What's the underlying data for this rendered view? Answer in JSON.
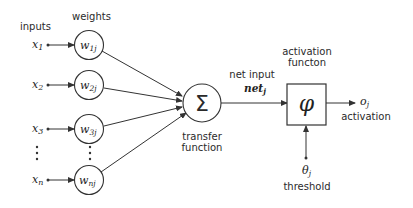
{
  "diagram": {
    "labels": {
      "inputs": "inputs",
      "weights": "weights",
      "net_input": "net input",
      "net_symbol": "net",
      "net_sub": "j",
      "transfer_line1": "transfer",
      "transfer_line2": "function",
      "activation_fn_line1": "activation",
      "activation_fn_line2": "functon",
      "output_symbol": "o",
      "output_sub": "j",
      "output_label": "activation",
      "threshold_symbol": "θ",
      "threshold_sub": "j",
      "threshold_label": "threshold",
      "sum_symbol": "Σ",
      "activation_symbol": "φ"
    },
    "inputs": [
      {
        "symbol": "x",
        "sub": "1",
        "weight": "w",
        "weight_sub": "1j"
      },
      {
        "symbol": "x",
        "sub": "2",
        "weight": "w",
        "weight_sub": "2j"
      },
      {
        "symbol": "x",
        "sub": "3",
        "weight": "w",
        "weight_sub": "3j"
      },
      {
        "symbol": "x",
        "sub": "n",
        "weight": "w",
        "weight_sub": "nj"
      }
    ],
    "ellipsis": "⋮"
  }
}
